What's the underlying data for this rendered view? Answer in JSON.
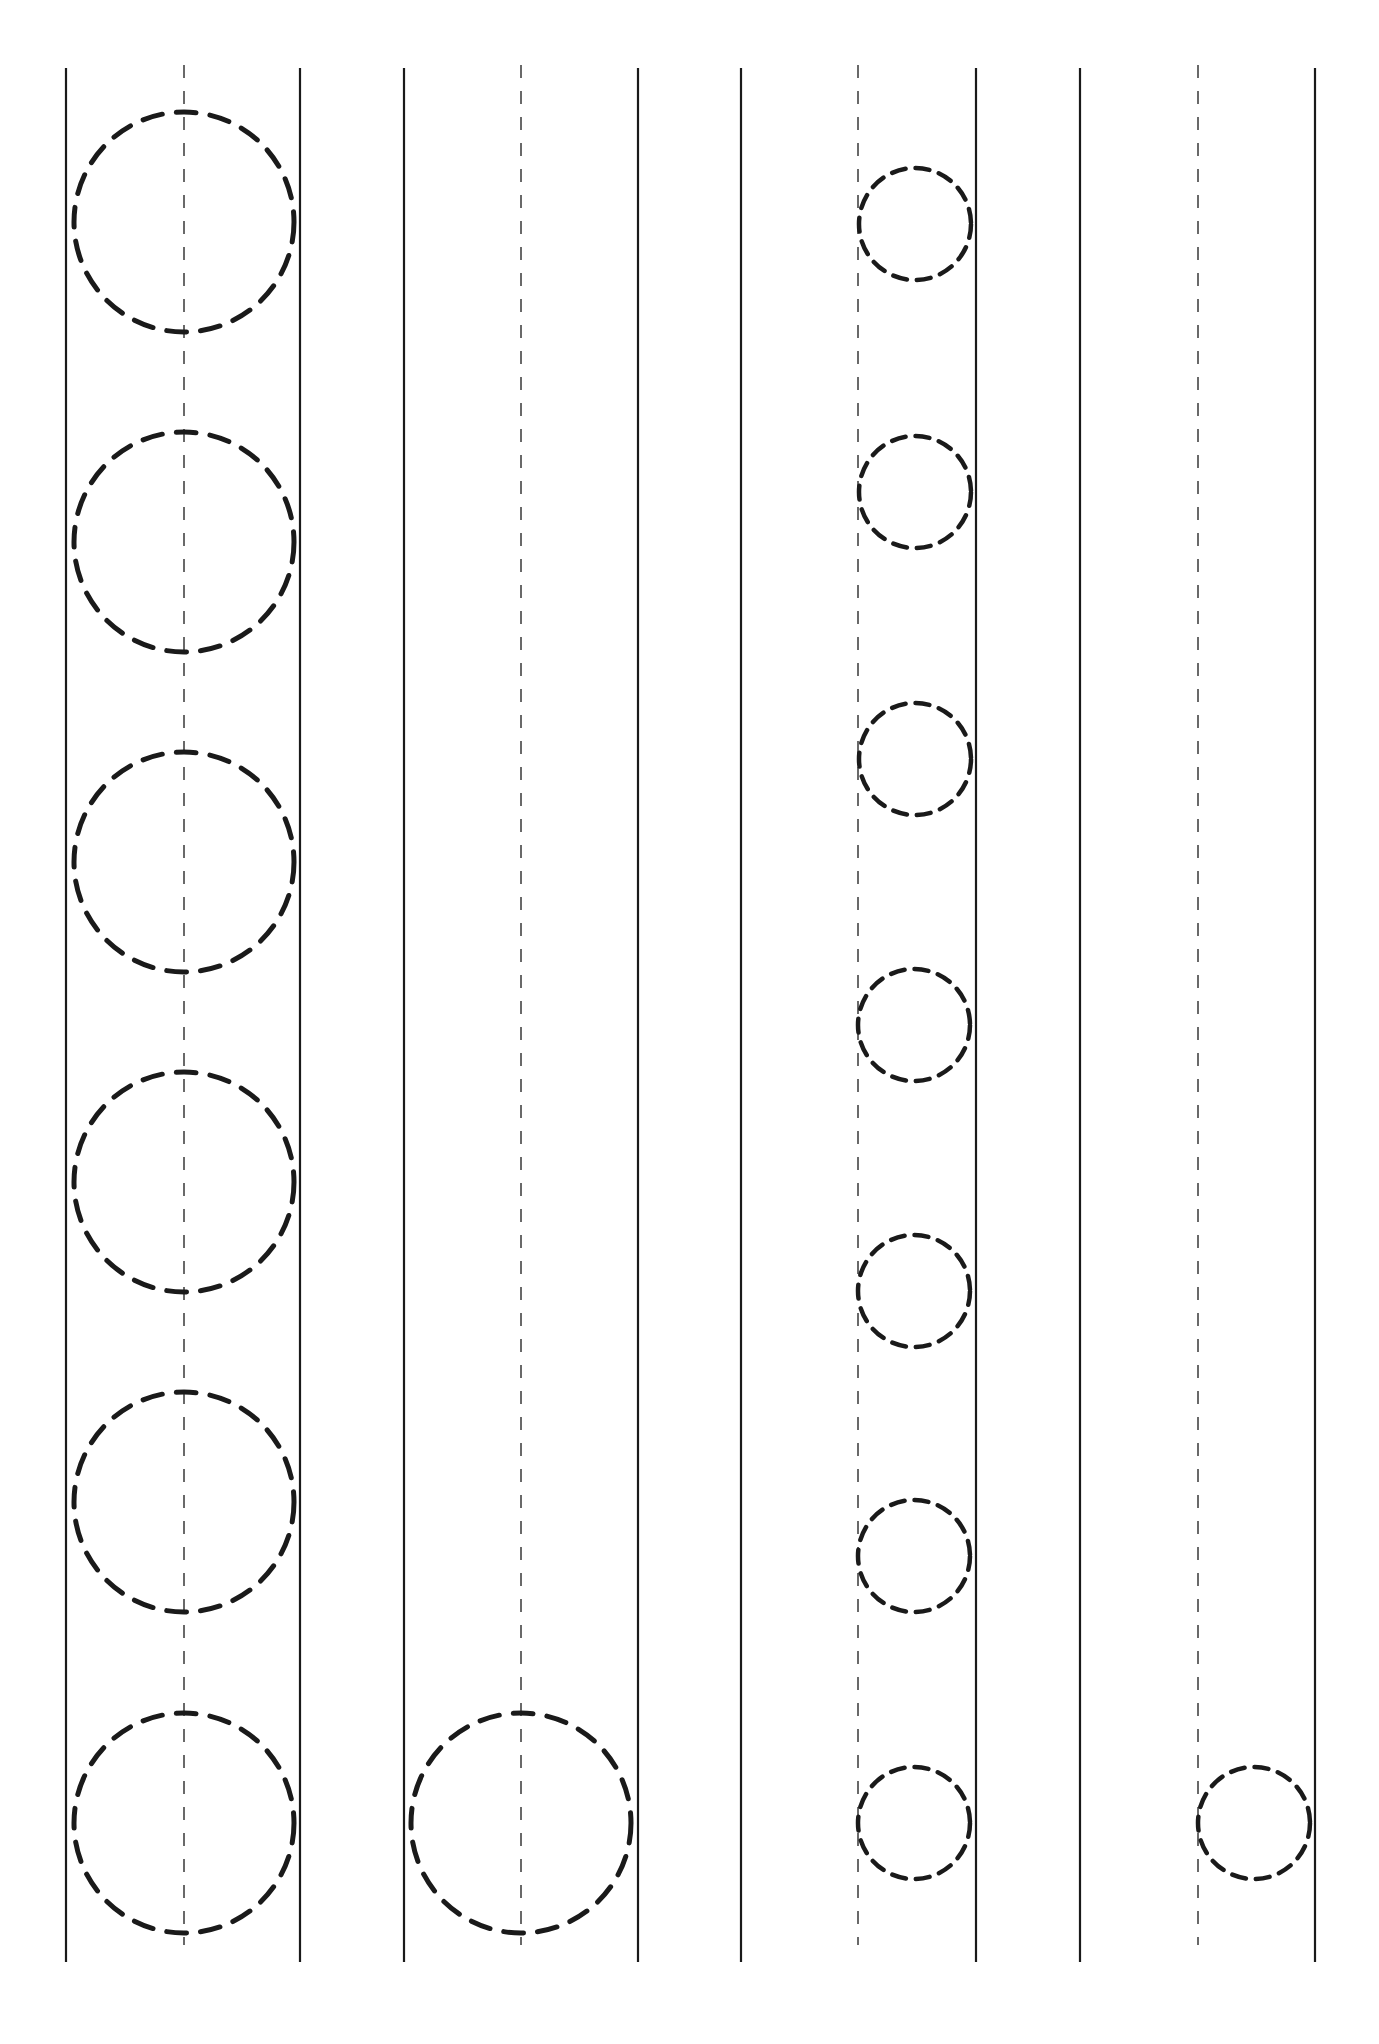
{
  "worksheet": {
    "type": "circle-tracing-practice",
    "background": "#ffffff",
    "ink_color": "#1a1a1a",
    "line_top": 68,
    "line_bottom": 1962,
    "guide_top": 65,
    "guide_bottom": 1945,
    "strips": [
      {
        "left": 66,
        "center": 184,
        "right": 300,
        "circles": [
          {
            "cx": 184,
            "cy": 222,
            "r": 110
          },
          {
            "cx": 184,
            "cy": 542,
            "r": 110
          },
          {
            "cx": 184,
            "cy": 862,
            "r": 110
          },
          {
            "cx": 184,
            "cy": 1182,
            "r": 110
          },
          {
            "cx": 184,
            "cy": 1502,
            "r": 110
          },
          {
            "cx": 184,
            "cy": 1823,
            "r": 110
          }
        ]
      },
      {
        "left": 404,
        "center": 521,
        "right": 638,
        "circles": [
          {
            "cx": 521,
            "cy": 1823,
            "r": 110
          }
        ]
      },
      {
        "left": 741,
        "center": 858,
        "right": 976,
        "circles": [
          {
            "cx": 915,
            "cy": 224,
            "r": 56
          },
          {
            "cx": 915,
            "cy": 492,
            "r": 56
          },
          {
            "cx": 915,
            "cy": 759,
            "r": 56
          },
          {
            "cx": 914,
            "cy": 1025,
            "r": 56
          },
          {
            "cx": 914,
            "cy": 1291,
            "r": 56
          },
          {
            "cx": 914,
            "cy": 1556,
            "r": 56
          },
          {
            "cx": 914,
            "cy": 1823,
            "r": 56
          }
        ]
      },
      {
        "left": 1080,
        "center": 1198,
        "right": 1315,
        "circles": [
          {
            "cx": 1254,
            "cy": 1823,
            "r": 56
          }
        ]
      }
    ]
  }
}
